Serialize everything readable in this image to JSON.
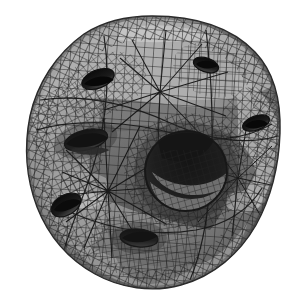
{
  "figure": {
    "subtitle": "",
    "caption": "",
    "render_mode": "flat-shaded wireframe",
    "colorspace": "grayscale",
    "background_color": "#ffffff",
    "wireframe_color": "#1b1b1b",
    "canvas": {
      "width": 298,
      "height": 304
    }
  },
  "palette": {
    "background": "#ffffff",
    "wire": "#1d1d1d",
    "wire_soft": "#3a3a3a",
    "shade_darkest": "#0d0d0d",
    "shade_dark": "#2e2e2e",
    "shade_mid_dark": "#4a4a4a",
    "shade_mid": "#6b6b6b",
    "shade_mid_light": "#8a8a8a",
    "shade_light": "#a9a9a9",
    "shade_lightest": "#c9c9c9",
    "highlight": "#dcdcdc"
  },
  "geometry": {
    "silhouette_bounds": {
      "left": 26,
      "top": 16,
      "right": 281,
      "bottom": 289
    },
    "center": {
      "x": 152,
      "y": 152
    },
    "outer_radius_x": 127,
    "outer_radius_y": 136,
    "mesh": {
      "type": "quad",
      "cell_size_px": 9,
      "u_divisions": 34,
      "v_divisions": 34,
      "line_width_px": 1
    },
    "holes": [
      {
        "name": "center-tunnel",
        "cx": 186,
        "cy": 171,
        "rx": 41,
        "ry": 40,
        "rotation": -8,
        "depth_shade": "#121212"
      },
      {
        "name": "upper-left-slit",
        "cx": 98,
        "cy": 79,
        "rx": 17,
        "ry": 9,
        "rotation": -22,
        "depth_shade": "#151515"
      },
      {
        "name": "upper-right-slit",
        "cx": 206,
        "cy": 65,
        "rx": 13,
        "ry": 7,
        "rotation": 18,
        "depth_shade": "#151515"
      },
      {
        "name": "left-slit",
        "cx": 86,
        "cy": 140,
        "rx": 22,
        "ry": 10,
        "rotation": -14,
        "depth_shade": "#101010"
      },
      {
        "name": "right-slit",
        "cx": 256,
        "cy": 123,
        "rx": 14,
        "ry": 7,
        "rotation": -20,
        "depth_shade": "#141414"
      },
      {
        "name": "lower-left-dimple",
        "cx": 66,
        "cy": 205,
        "rx": 16,
        "ry": 10,
        "rotation": -30,
        "depth_shade": "#1a1a1a"
      },
      {
        "name": "lower-center-slit",
        "cx": 139,
        "cy": 238,
        "rx": 19,
        "ry": 9,
        "rotation": 6,
        "depth_shade": "#131313"
      }
    ],
    "fan_vertices": [
      {
        "name": "left-fan-hub",
        "x": 108,
        "y": 191,
        "spokes": 12
      },
      {
        "name": "upper-fan-hub",
        "x": 160,
        "y": 92,
        "spokes": 10
      },
      {
        "name": "right-fan-hub",
        "x": 238,
        "y": 178,
        "spokes": 10
      }
    ]
  },
  "chart_data": {
    "type": "heatmap",
    "xlabel": "",
    "ylabel": "",
    "grid": true,
    "legend": "none",
    "luminance_scale": {
      "min": 0,
      "max": 255,
      "stops": [
        13,
        46,
        74,
        107,
        138,
        169,
        201,
        220
      ]
    }
  }
}
